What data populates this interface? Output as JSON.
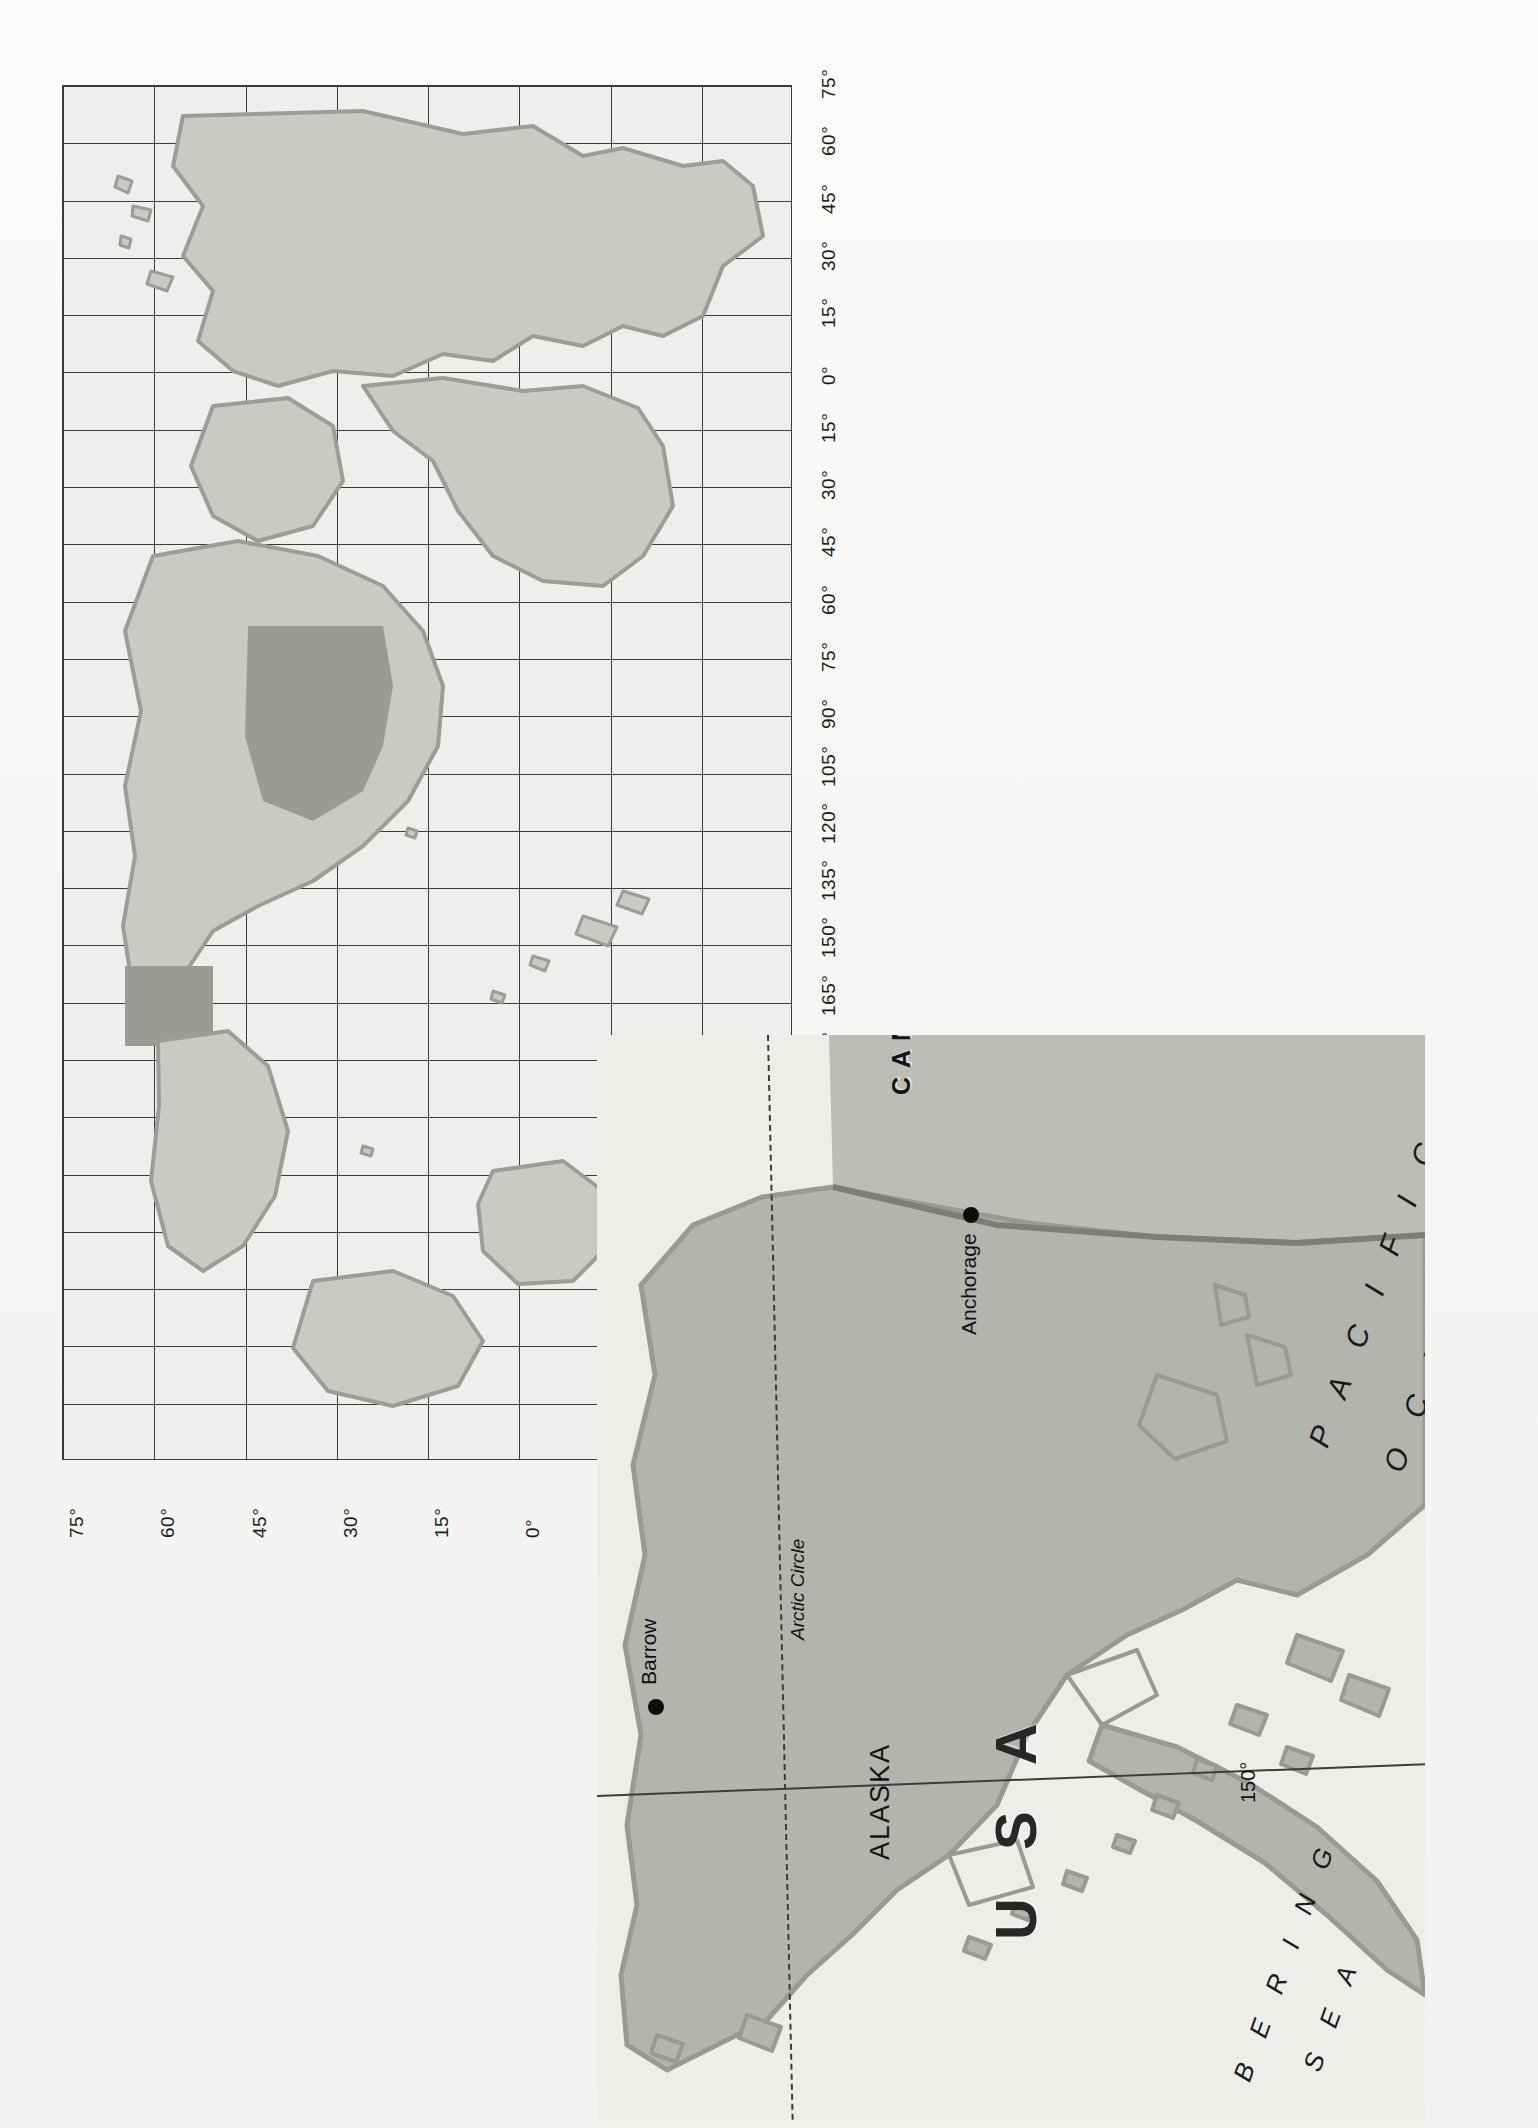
{
  "page": {
    "orientation": "rotated-90",
    "background_color": "#f4f4f2"
  },
  "world_map": {
    "name": "world-locator-map",
    "frame_color": "#3a3a3a",
    "ocean_color": "#eeeeec",
    "land_color": "#c9c9c5",
    "highlight_color": "#9b9b96",
    "longitude_labels": [
      "75°",
      "60°",
      "45°",
      "30°",
      "15°",
      "0°",
      "15°",
      "30°",
      "45°",
      "60°",
      "75°",
      "90°",
      "105°",
      "120°",
      "135°",
      "150°",
      "165°",
      "180°",
      "165°",
      "150°",
      "135°",
      "120°",
      "105°",
      "90°",
      "75°"
    ],
    "latitude_labels": [
      "75°",
      "60°",
      "45°",
      "30°",
      "15°",
      "0°",
      "15°",
      "30°",
      "45°"
    ]
  },
  "inset_map": {
    "name": "alaska-inset-map",
    "land_color": "#b4b4ae",
    "sea_color": "#ededea",
    "labels": {
      "canada": "CANADA",
      "usa": "U S A",
      "alaska": "ALASKA",
      "pacific": "P A C I F I C",
      "ocean": "O C E A N",
      "bering": "B E R I N G",
      "sea": "S E A",
      "barrow": "Barrow",
      "anchorage": "Anchorage",
      "arctic_circle": "Arctic Circle",
      "lat_65": "65°",
      "lon_150": "150°"
    }
  }
}
